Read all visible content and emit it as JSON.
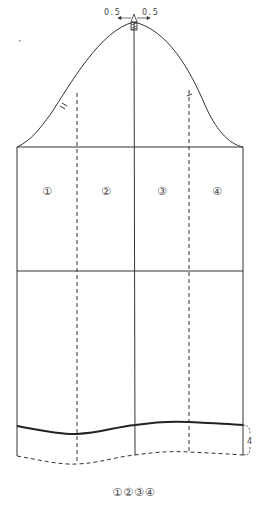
{
  "diagram": {
    "type": "sleeve-pattern",
    "top_marks": {
      "left": "0.5",
      "right": "0.5",
      "apex": "A"
    },
    "panels": [
      {
        "label": "①"
      },
      {
        "label": "②"
      },
      {
        "label": "③"
      },
      {
        "label": "④"
      }
    ],
    "hem_extension": "4",
    "caption": "①②③④",
    "colors": {
      "line": "#333333",
      "background": "#ffffff"
    }
  }
}
